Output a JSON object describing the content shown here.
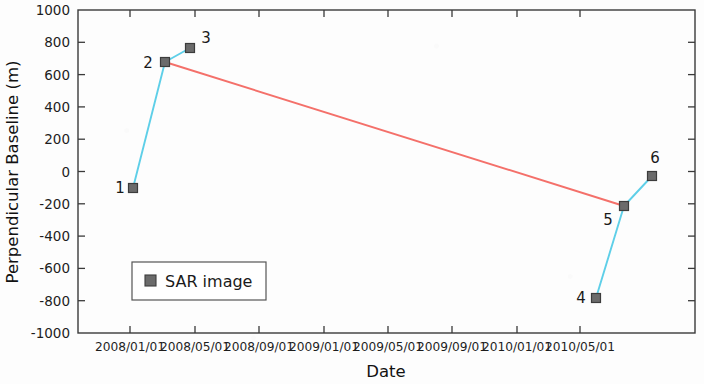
{
  "chart_data": {
    "type": "scatter",
    "title": "",
    "xlabel": "Date",
    "ylabel": "Perpendicular Baseline (m)",
    "ylim": [
      -1000,
      1000
    ],
    "xlim": [
      "2007/11/01",
      "2010/05/01"
    ],
    "grid": false,
    "legend": {
      "position": "lower-left",
      "entries": [
        "SAR image"
      ]
    },
    "y_ticks": [
      "1000",
      "800",
      "600",
      "400",
      "200",
      "0",
      "-200",
      "-400",
      "-600",
      "-800",
      "-1000"
    ],
    "y_tick_values": [
      1000,
      800,
      600,
      400,
      200,
      0,
      -200,
      -400,
      -600,
      -800,
      -1000
    ],
    "x_ticks": [
      "2008/01/01",
      "2008/05/01",
      "2008/09/01",
      "2009/01/01",
      "2009/05/01",
      "2009/09/01",
      "2010/01/01",
      "2010/05/01"
    ],
    "points": [
      {
        "label": "1",
        "date": "2008/01/01",
        "value": -100,
        "px": 133,
        "py": 188,
        "lx": 120,
        "ly": 193
      },
      {
        "label": "2",
        "date": "2008/03/01",
        "value": 700,
        "px": 165,
        "py": 62,
        "lx": 148,
        "ly": 68
      },
      {
        "label": "3",
        "date": "2008/04/20",
        "value": 780,
        "px": 190,
        "py": 48,
        "lx": 206,
        "ly": 43
      },
      {
        "label": "4",
        "date": "2010/01/01",
        "value": -760,
        "px": 596,
        "py": 298,
        "lx": 581,
        "ly": 303
      },
      {
        "label": "5",
        "date": "2010/02/15",
        "value": -190,
        "px": 624,
        "py": 206,
        "lx": 608,
        "ly": 225
      },
      {
        "label": "6",
        "date": "2010/04/05",
        "value": 0,
        "px": 652,
        "py": 176,
        "lx": 655,
        "ly": 163
      }
    ],
    "edges": [
      {
        "from": "1",
        "to": "2",
        "color": "#5ecfe8",
        "kind": "short-baseline"
      },
      {
        "from": "2",
        "to": "3",
        "color": "#5ecfe8",
        "kind": "short-baseline"
      },
      {
        "from": "2",
        "to": "5",
        "color": "#f4706a",
        "kind": "long-baseline"
      },
      {
        "from": "4",
        "to": "5",
        "color": "#5ecfe8",
        "kind": "short-baseline"
      },
      {
        "from": "5",
        "to": "6",
        "color": "#5ecfe8",
        "kind": "short-baseline"
      }
    ],
    "colors": {
      "marker": "#6b6b6b",
      "marker_edge": "#3c3c3c",
      "cyan_line": "#5ecfe8",
      "red_line": "#f4706a",
      "axis": "#3a3a3a",
      "background": "#fdfdfd"
    },
    "legend_label": "SAR image"
  }
}
